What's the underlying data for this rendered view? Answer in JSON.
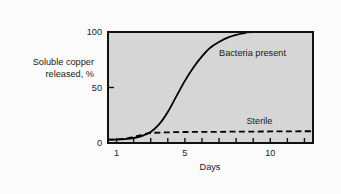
{
  "chart_data": {
    "type": "line",
    "title": "",
    "subtitle": "",
    "xlabel": "Days",
    "ylabel": "Soluble copper released, %",
    "ylabel_line1": "Soluble copper",
    "ylabel_line2": "released, %",
    "xlim": [
      0.5,
      12.5
    ],
    "ylim": [
      0,
      100
    ],
    "xticks": [
      1,
      2,
      3,
      4,
      5,
      6,
      7,
      8,
      9,
      10,
      11,
      12
    ],
    "xtick_labels": [
      "1",
      "5",
      "10"
    ],
    "xtick_label_values": [
      1,
      5,
      10
    ],
    "yticks": [
      0,
      50,
      100
    ],
    "ytick_labels": [
      "0",
      "50",
      "100"
    ],
    "grid": false,
    "legend_position": "inline-annotations",
    "plot_background": "#d6d6d6",
    "frame_color": "#111111",
    "line_color": "#000000",
    "series": [
      {
        "name": "Bacteria present",
        "style": "solid",
        "label_x": 7.0,
        "label_y": 78,
        "x": [
          0.5,
          1.0,
          1.5,
          2.0,
          2.5,
          3.0,
          3.5,
          4.0,
          4.5,
          5.0,
          5.5,
          6.0,
          6.5,
          7.0,
          7.5,
          8.0,
          8.5,
          9.0,
          12.5
        ],
        "values": [
          3,
          3,
          3.5,
          4.5,
          6.5,
          10,
          17,
          28,
          42,
          56,
          68,
          78,
          86,
          91,
          95,
          97.5,
          99,
          100,
          100
        ]
      },
      {
        "name": "Sterile",
        "style": "dashed",
        "label_x": 8.6,
        "label_y": 17,
        "x": [
          0.5,
          1.0,
          1.5,
          2.0,
          2.5,
          3.0,
          4.0,
          5.0,
          6.0,
          7.0,
          8.0,
          9.0,
          10.0,
          11.0,
          12.0,
          12.5
        ],
        "values": [
          3,
          3.2,
          4,
          5.5,
          7.5,
          9,
          9.6,
          9.9,
          10,
          10.1,
          10.2,
          10.3,
          10.4,
          10.5,
          10.6,
          10.6
        ]
      }
    ]
  }
}
